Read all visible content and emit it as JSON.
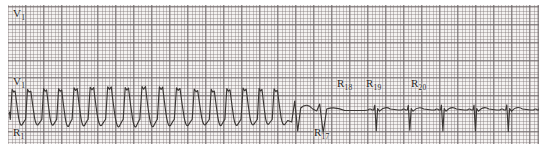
{
  "figure": {
    "kind": "ecg-rhythm-strip",
    "width": 547,
    "height": 149,
    "paper_color": "#f4f2f1",
    "grid_color": "#6e686a",
    "trace_color": "#3a3634"
  },
  "strips": [
    {
      "id": "strip-top",
      "lead_label": "V",
      "lead_sub": "1",
      "rhythm": "wide-complex tachycardia",
      "beat_count": 37,
      "annotations": []
    },
    {
      "id": "strip-bottom",
      "lead_label": "V",
      "lead_sub": "1",
      "rhythm": "tachycardia terminating to sinus rhythm",
      "beat_count": 24,
      "annotations": [
        {
          "name": "R",
          "sub": "1",
          "x": 13,
          "y": 127
        },
        {
          "name": "R",
          "sub": "17",
          "x": 314,
          "y": 127
        },
        {
          "name": "R",
          "sub": "18",
          "x": 337,
          "y": 78
        },
        {
          "name": "R",
          "sub": "19",
          "x": 366,
          "y": 78
        },
        {
          "name": "R",
          "sub": "20",
          "x": 411,
          "y": 78
        }
      ]
    }
  ],
  "chart_data": {
    "type": "line",
    "title": "",
    "xlabel": "",
    "ylabel": "",
    "series": [
      {
        "name": "V1 top strip",
        "description": "Monomorphic wide-complex tachycardia, regular, approximately 37 consecutive beats across the full strip width with no termination.",
        "beat_interval_px": 14.3,
        "peak_y_px": 18,
        "trough_y_px": 55,
        "baseline_y_px": 40
      },
      {
        "name": "V1 bottom strip",
        "description": "Same tachycardia for beats R1 through R17, then abrupt termination; R18 and R19 are narrow transitional complexes, R20 onward are narrow sinus beats with deep negative QRS and rounded T waves.",
        "wide_beats": 17,
        "narrow_beats": 7,
        "wide_beat_interval_px": 17.2,
        "narrow_beat_interval_px": 33,
        "termination_x_px": 330,
        "baseline_y_px": 110
      }
    ],
    "grid": {
      "major_mm_px": 18,
      "minor_mm_px": 3.6,
      "on": true
    }
  }
}
